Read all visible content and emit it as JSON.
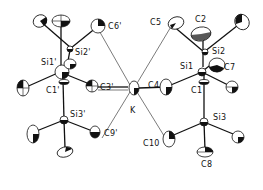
{
  "diagram": {
    "type": "ORTEP molecular structure",
    "labels": {
      "c6p": "C6'",
      "si2p": "Si2'",
      "si1p": "Si1'",
      "c1p": "C1'",
      "c3p": "C3'",
      "si3p": "Si3'",
      "c9p": "C9'",
      "k": "K",
      "c4": "C4",
      "c5": "C5",
      "c2": "C2",
      "si2": "Si2",
      "si1": "Si1",
      "c7": "C7",
      "c1": "C1",
      "si3": "Si3",
      "c10": "C10",
      "c8": "C8"
    }
  }
}
